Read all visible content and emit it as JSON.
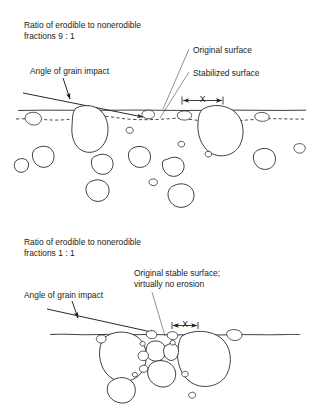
{
  "figure": {
    "title_absent": true,
    "background_color": "#ffffff",
    "ink_color": "#1d1d1d",
    "panels": [
      {
        "id": "panel-top",
        "caption_line1": "Ratio of erodible to nonerodible",
        "caption_line2": "fractions 9 : 1",
        "labels": {
          "angle_of_grain_impact": "Angle of grain impact",
          "original_surface": "Original surface",
          "stabilized_surface": "Stabilized surface"
        },
        "dimension_marker": "X"
      },
      {
        "id": "panel-bottom",
        "caption_line1": "Ratio of erodible to nonerodible",
        "caption_line2": "fractions 1 : 1",
        "labels": {
          "angle_of_grain_impact": "Angle of grain impact",
          "original_stable_surface_line1": "Original stable surface;",
          "original_stable_surface_line2": "virtually no erosion"
        },
        "dimension_marker": "X"
      }
    ]
  }
}
